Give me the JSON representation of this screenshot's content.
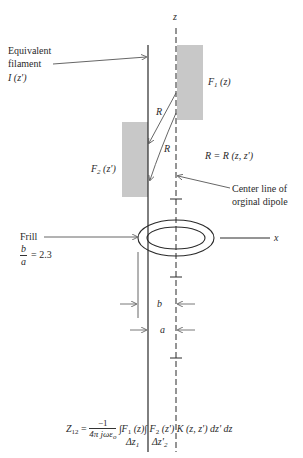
{
  "diagram": {
    "axis_labels": {
      "z": "z",
      "x": "x"
    },
    "filament_label": [
      "Equivalent",
      "filament",
      "I (z')"
    ],
    "f1_label": "F",
    "f1_sub": "1",
    "f1_arg": " (z)",
    "f2_label": "F",
    "f2_sub": "2",
    "f2_arg": " (z')",
    "r_label_1": "R",
    "r_label_2": "R",
    "r_relation": "R = R (z, z')",
    "center_line_label": [
      "Center line of",
      "orginal dipole"
    ],
    "frill_label": "Frill",
    "ratio_num": "b",
    "ratio_den": "a",
    "ratio_value": "= 2.3",
    "dim_b": "b",
    "dim_a": "a",
    "equation": {
      "lhs": "Z",
      "lhs_sub": "12",
      "equals": " = ",
      "frac_num": "−1",
      "frac_den": "4π jωε",
      "frac_den_sub": "o",
      "body": "∫F",
      "f1_sub": "1",
      "f1_arg": " (z)∫ F",
      "f2_sub": "2",
      "rest": " (z') K (z, z') dz' dz",
      "lim1": "Δz",
      "lim1_sub": "1",
      "lim2": "Δz'",
      "lim2_sub": "2"
    },
    "colors": {
      "line": "#2a2a2a",
      "shade": "#c8c8c8",
      "arrow": "#555555"
    }
  }
}
